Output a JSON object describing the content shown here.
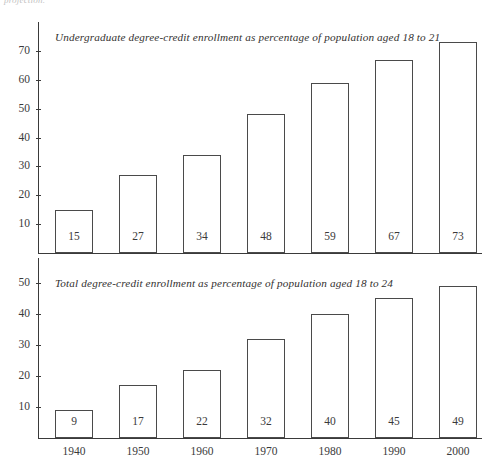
{
  "page": {
    "top_fragment": "projection."
  },
  "chart_data": [
    {
      "type": "bar",
      "id": "undergraduate",
      "title": "Undergraduate degree-credit enrollment as percentage of population aged 18 to 21",
      "categories": [
        "1940",
        "1950",
        "1960",
        "1970",
        "1980",
        "1990",
        "2000"
      ],
      "values": [
        15,
        27,
        34,
        48,
        59,
        67,
        73
      ],
      "yticks": [
        10,
        20,
        30,
        40,
        50,
        60,
        70
      ],
      "ylim": [
        0,
        80
      ],
      "xlabel": "",
      "ylabel": "",
      "grid": false,
      "legend": "none",
      "bar_style": "outlined",
      "bar_color": "#ffffff",
      "bar_border_color": "#4a4a4a",
      "axis_color": "#3a3a3a",
      "show_xticklabels": false
    },
    {
      "type": "bar",
      "id": "total",
      "title": "Total degree-credit enrollment as percentage of population aged 18 to 24",
      "categories": [
        "1940",
        "1950",
        "1960",
        "1970",
        "1980",
        "1990",
        "2000"
      ],
      "values": [
        9,
        17,
        22,
        32,
        40,
        45,
        49
      ],
      "yticks": [
        10,
        20,
        30,
        40,
        50
      ],
      "ylim": [
        0,
        58
      ],
      "xlabel": "",
      "ylabel": "",
      "grid": false,
      "legend": "none",
      "bar_style": "outlined",
      "bar_color": "#ffffff",
      "bar_border_color": "#4a4a4a",
      "axis_color": "#3a3a3a",
      "show_xticklabels": true
    }
  ]
}
